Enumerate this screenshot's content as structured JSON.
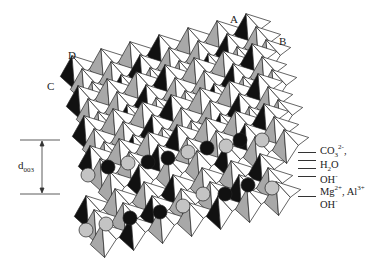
{
  "diagram": {
    "title": "",
    "type": "layered double hydroxide crystal structure",
    "corner_labels": {
      "A": "A",
      "B": "B",
      "C": "C",
      "D": "D"
    },
    "spacing_label": {
      "main": "d",
      "sub": "003"
    },
    "legend": [
      {
        "id": "carbonate",
        "base": "CO",
        "sub": "3",
        "sup": "2-",
        "suffix": ",",
        "y": 147
      },
      {
        "id": "water",
        "base": "H",
        "sub": "2",
        "tail": "O",
        "y": 162
      },
      {
        "id": "hydroxide-top",
        "base": "OH",
        "sup": "-",
        "y": 177
      },
      {
        "id": "metal-cations",
        "text1": "Mg",
        "sup1": "2+",
        "mid": ", Al",
        "sup2": "3+",
        "y": 190
      },
      {
        "id": "hydroxide-bottom",
        "base": "OH",
        "sup": "-",
        "y": 207
      }
    ],
    "colors": {
      "octahedron_white": "#ffffff",
      "octahedron_gray": "#a8a8a8",
      "octahedron_black": "#111111",
      "sphere_dark": "#111111",
      "sphere_light": "#c4c4c4",
      "stroke": "#222222"
    }
  }
}
